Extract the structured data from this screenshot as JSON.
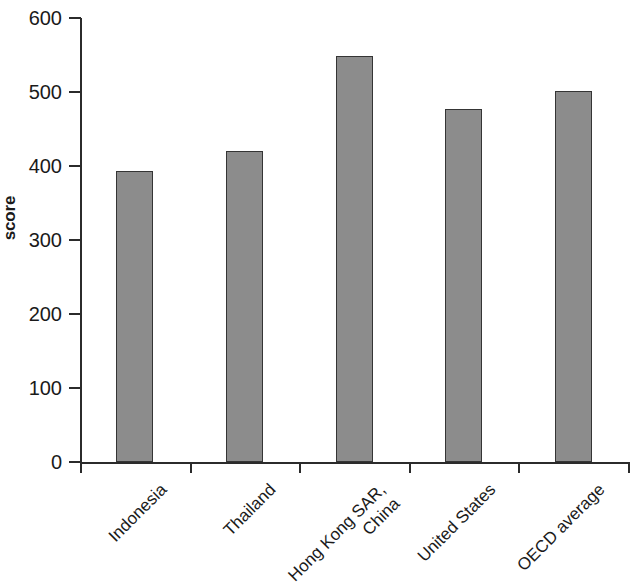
{
  "chart_data": {
    "type": "bar",
    "title": "",
    "xlabel": "",
    "ylabel": "score",
    "ylim": [
      0,
      600
    ],
    "yticks": [
      0,
      100,
      200,
      300,
      400,
      500,
      600
    ],
    "grid": false,
    "legend": null,
    "categories": [
      "Indonesia",
      "Thailand",
      "Hong Kong SAR,\nChina",
      "United States",
      "OECD average"
    ],
    "values": [
      393,
      420,
      548,
      477,
      501
    ],
    "bar_color": "#8c8c8c",
    "bar_border_color": "#353535",
    "axis_color": "#2b2b2b",
    "background_color": "#ffffff"
  },
  "axis": {
    "y_label": "score",
    "y_ticks": [
      "600",
      "500",
      "400",
      "300",
      "200",
      "100",
      "0"
    ]
  },
  "bars": [
    {
      "category": "Indonesia",
      "label": "Indonesia",
      "value": 393
    },
    {
      "category": "Thailand",
      "label": "Thailand",
      "value": 420
    },
    {
      "category": "Hong Kong SAR, China",
      "label": "Hong Kong SAR,\nChina",
      "value": 548
    },
    {
      "category": "United States",
      "label": "United States",
      "value": 477
    },
    {
      "category": "OECD average",
      "label": "OECD average",
      "value": 501
    }
  ]
}
